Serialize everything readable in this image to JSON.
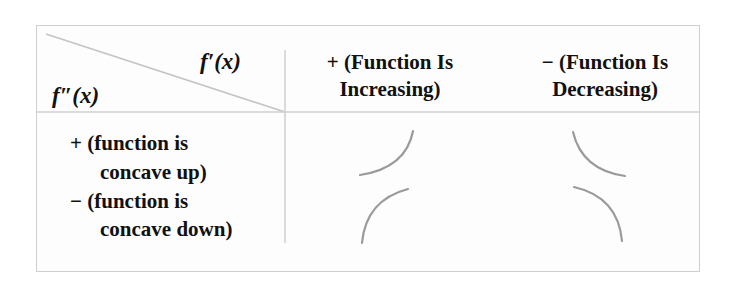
{
  "table": {
    "corner": {
      "column_var": "f′(x)",
      "row_var": "f″(x)"
    },
    "columns": [
      {
        "sign": "+",
        "line1": "+ (Function Is",
        "line2": "Increasing)"
      },
      {
        "sign": "−",
        "line1": "− (Function Is",
        "line2": "Decreasing)"
      }
    ],
    "rows": [
      {
        "sign": "+",
        "line1": "+ (function is",
        "line2": "concave up)"
      },
      {
        "sign": "−",
        "line1": "− (function is",
        "line2": "concave down)"
      }
    ],
    "cells": [
      {
        "row": "+",
        "col": "+",
        "shape": "increasing, concave up"
      },
      {
        "row": "+",
        "col": "−",
        "shape": "decreasing, concave up"
      },
      {
        "row": "−",
        "col": "+",
        "shape": "increasing, concave down"
      },
      {
        "row": "−",
        "col": "−",
        "shape": "decreasing, concave down"
      }
    ]
  },
  "colors": {
    "border": "#cfcfcf",
    "curve": "#9a9a9a",
    "text": "#111111"
  }
}
